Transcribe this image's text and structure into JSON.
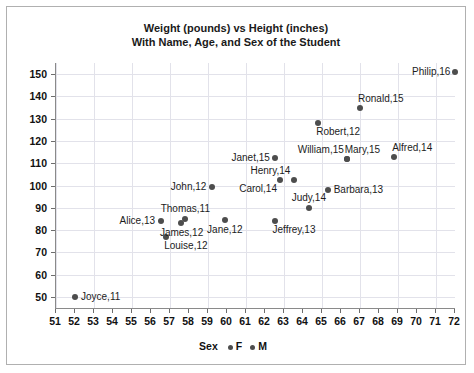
{
  "chart_data": {
    "type": "scatter",
    "title": "Weight (pounds) vs Height (inches)",
    "subtitle": "With Name, Age, and Sex of the Student",
    "xlabel": "",
    "ylabel": "",
    "xlim": [
      51,
      72
    ],
    "ylim": [
      45,
      155
    ],
    "x_ticks": [
      51,
      52,
      53,
      54,
      55,
      56,
      57,
      58,
      59,
      60,
      61,
      62,
      63,
      64,
      65,
      66,
      67,
      68,
      69,
      70,
      71,
      72
    ],
    "y_ticks": [
      50,
      60,
      70,
      80,
      90,
      100,
      110,
      120,
      130,
      140,
      150
    ],
    "grid": true,
    "legend": {
      "title": "Sex",
      "position": "bottom",
      "entries": [
        {
          "label": "F",
          "color": "#4d4d4d"
        },
        {
          "label": "M",
          "color": "#4d4d4d"
        }
      ]
    },
    "marker_color": "#4d4d4d",
    "points": [
      {
        "name": "Joyce",
        "age": 11,
        "sex": "F",
        "x": 52.0,
        "y": 50.0,
        "label": "Joyce,11",
        "label_pos": "right"
      },
      {
        "name": "Alice",
        "age": 13,
        "sex": "F",
        "x": 56.5,
        "y": 84.0,
        "label": "Alice,13",
        "label_pos": "left"
      },
      {
        "name": "Louise",
        "age": 12,
        "sex": "F",
        "x": 56.8,
        "y": 77.0,
        "label": "Louise,12",
        "label_pos": "below-right"
      },
      {
        "name": "James",
        "age": 12,
        "sex": "M",
        "x": 57.6,
        "y": 83.0,
        "label": "James,12",
        "label_pos": "below"
      },
      {
        "name": "Thomas",
        "age": 11,
        "sex": "M",
        "x": 57.8,
        "y": 85.0,
        "label": "Thomas,11",
        "label_pos": "above"
      },
      {
        "name": "Jane",
        "age": 12,
        "sex": "F",
        "x": 59.9,
        "y": 84.5,
        "label": "Jane,12",
        "label_pos": "below"
      },
      {
        "name": "John",
        "age": 12,
        "sex": "M",
        "x": 59.2,
        "y": 99.5,
        "label": "John,12",
        "label_pos": "left"
      },
      {
        "name": "Jeffrey",
        "age": 13,
        "sex": "M",
        "x": 62.5,
        "y": 84.0,
        "label": "Jeffrey,13",
        "label_pos": "below-right"
      },
      {
        "name": "Janet",
        "age": 15,
        "sex": "F",
        "x": 62.5,
        "y": 112.5,
        "label": "Janet,15",
        "label_pos": "left"
      },
      {
        "name": "Carol",
        "age": 14,
        "sex": "F",
        "x": 62.8,
        "y": 102.5,
        "label": "Carol,14",
        "label_pos": "below-left"
      },
      {
        "name": "Henry",
        "age": 14,
        "sex": "M",
        "x": 63.5,
        "y": 102.5,
        "label": "Henry,14",
        "label_pos": "above-left"
      },
      {
        "name": "Judy",
        "age": 14,
        "sex": "F",
        "x": 64.3,
        "y": 90.0,
        "label": "Judy,14",
        "label_pos": "above"
      },
      {
        "name": "Barbara",
        "age": 13,
        "sex": "F",
        "x": 65.3,
        "y": 98.0,
        "label": "Barbara,13",
        "label_pos": "right"
      },
      {
        "name": "Robert",
        "age": 12,
        "sex": "M",
        "x": 64.8,
        "y": 128.0,
        "label": "Robert,12",
        "label_pos": "below-right"
      },
      {
        "name": "Mary",
        "age": 15,
        "sex": "F",
        "x": 66.3,
        "y": 112.0,
        "label": "Mary,15",
        "label_pos": "above-right"
      },
      {
        "name": "William",
        "age": 15,
        "sex": "M",
        "x": 66.3,
        "y": 112.0,
        "label": "William,15",
        "label_pos": "above-left"
      },
      {
        "name": "Ronald",
        "age": 15,
        "sex": "M",
        "x": 67.0,
        "y": 135.0,
        "label": "Ronald,15",
        "label_pos": "above-right"
      },
      {
        "name": "Alfred",
        "age": 14,
        "sex": "M",
        "x": 68.8,
        "y": 113.0,
        "label": "Alfred,14",
        "label_pos": "above-right"
      },
      {
        "name": "Philip",
        "age": 16,
        "sex": "M",
        "x": 72.0,
        "y": 151.0,
        "label": "Philip,16",
        "label_pos": "left"
      }
    ]
  }
}
